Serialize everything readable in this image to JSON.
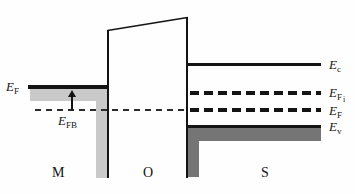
{
  "diagram": {
    "type": "MOS flat-band energy band diagram",
    "regions": {
      "metal": {
        "label": "M"
      },
      "oxide": {
        "label": "O"
      },
      "semiconductor": {
        "label": "S"
      }
    },
    "levels": {
      "metal_fermi": {
        "base": "E",
        "sub": "F"
      },
      "flatband": {
        "base": "E",
        "sub": "FB"
      },
      "conduction_band": {
        "base": "E",
        "sub": "c"
      },
      "intrinsic_fermi": {
        "base": "E",
        "sub": "F",
        "subsub": "i"
      },
      "semiconductor_fermi": {
        "base": "E",
        "sub": "F"
      },
      "valence_band": {
        "base": "E",
        "sub": "v"
      }
    },
    "colors": {
      "line": "#141414",
      "metal_fill": "#c9c9c9",
      "semiconductor_fill": "#757575",
      "background": "#fefefe"
    }
  }
}
